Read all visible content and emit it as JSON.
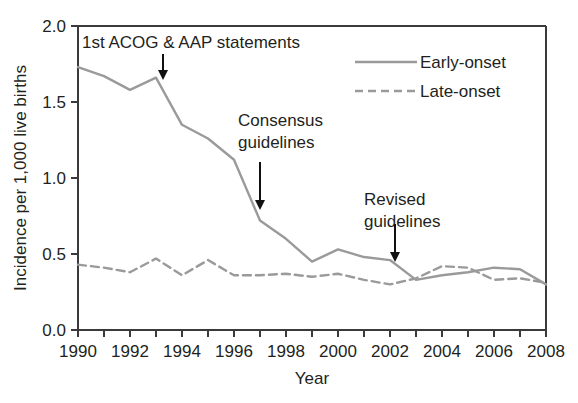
{
  "chart_data": {
    "type": "line",
    "title": "",
    "xlabel": "Year",
    "ylabel": "Incidence per 1,000 live births",
    "xlim": [
      1990,
      2008
    ],
    "ylim": [
      0.0,
      2.0
    ],
    "grid": false,
    "legend_position": "top-right",
    "x": [
      1990,
      1991,
      1992,
      1993,
      1994,
      1995,
      1996,
      1997,
      1998,
      1999,
      2000,
      2001,
      2002,
      2003,
      2004,
      2005,
      2006,
      2007,
      2008
    ],
    "xticks": [
      1990,
      1991,
      1992,
      1993,
      1994,
      1995,
      1996,
      1997,
      1998,
      1999,
      2000,
      2001,
      2002,
      2003,
      2004,
      2005,
      2006,
      2007,
      2008
    ],
    "xtick_labels": [
      "1990",
      "",
      "1992",
      "",
      "1994",
      "",
      "1996",
      "",
      "1998",
      "",
      "2000",
      "",
      "2002",
      "",
      "2004",
      "",
      "2006",
      "",
      "2008"
    ],
    "yticks": [
      0.0,
      0.5,
      1.0,
      1.5,
      2.0
    ],
    "ytick_labels": [
      "0.0",
      "0.5",
      "1.0",
      "1.5",
      "2.0"
    ],
    "series": [
      {
        "name": "Early-onset",
        "style": "solid",
        "color": "#9a9a9a",
        "values": [
          1.73,
          1.67,
          1.58,
          1.66,
          1.35,
          1.26,
          1.12,
          0.72,
          0.6,
          0.45,
          0.53,
          0.48,
          0.46,
          0.33,
          0.36,
          0.38,
          0.41,
          0.4,
          0.3
        ]
      },
      {
        "name": "Late-onset",
        "style": "dashed",
        "color": "#9a9a9a",
        "values": [
          0.43,
          0.41,
          0.38,
          0.47,
          0.36,
          0.46,
          0.36,
          0.36,
          0.37,
          0.35,
          0.37,
          0.33,
          0.3,
          0.34,
          0.42,
          0.41,
          0.33,
          0.34,
          0.31
        ]
      }
    ],
    "annotations": [
      {
        "id": "acog-aap",
        "text_lines": [
          "1st ACOG & AAP statements"
        ],
        "target_year": 1993,
        "arrow": "down"
      },
      {
        "id": "consensus",
        "text_lines": [
          "Consensus",
          "guidelines"
        ],
        "target_year": 1996.8,
        "arrow": "down"
      },
      {
        "id": "revised",
        "text_lines": [
          "Revised",
          "guidelines"
        ],
        "target_year": 2002.1,
        "arrow": "down"
      }
    ]
  },
  "legend": {
    "items": [
      {
        "label": "Early-onset",
        "style": "solid"
      },
      {
        "label": "Late-onset",
        "style": "dashed"
      }
    ]
  },
  "colors": {
    "line": "#9a9a9a",
    "axis": "#3a3a3a",
    "text": "#231f20",
    "arrow": "#111111",
    "background": "#ffffff"
  }
}
